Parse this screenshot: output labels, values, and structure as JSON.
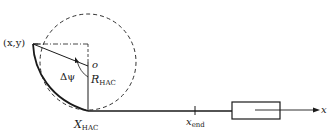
{
  "diagram": {
    "type": "geometric-schematic",
    "labels": {
      "point": "(x,y)",
      "center": "o",
      "angle": "Δψ",
      "radius_main": "R",
      "radius_sub": "HAC",
      "tangent_main": "X",
      "tangent_sub": "HAC",
      "end_main": "x",
      "end_sub": "end",
      "axis": "x"
    },
    "colors": {
      "stroke": "#1a1a1a",
      "background": "#ffffff"
    }
  }
}
